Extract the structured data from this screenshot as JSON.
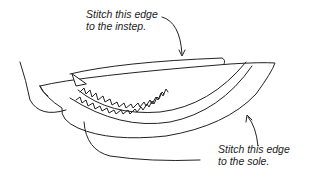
{
  "diagram": {
    "labels": {
      "instep": {
        "line1": "Stitch this edge",
        "line2": "to the instep."
      },
      "sole": {
        "line1": "Stitch this edge",
        "line2": "to the sole."
      }
    },
    "colors": {
      "line": "#222222",
      "background": "#ffffff"
    }
  }
}
